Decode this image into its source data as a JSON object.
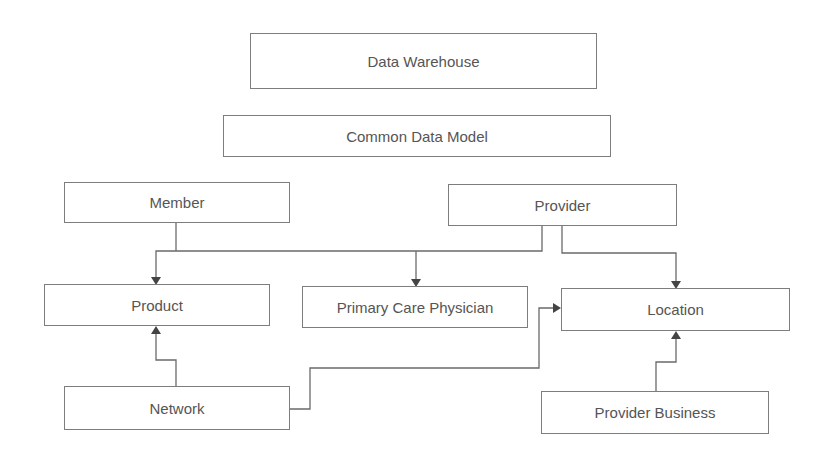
{
  "diagram": {
    "nodes": {
      "data_warehouse": "Data Warehouse",
      "common_data_model": "Common Data Model",
      "member": "Member",
      "provider": "Provider",
      "product": "Product",
      "primary_care_physician": "Primary Care Physician",
      "location": "Location",
      "network": "Network",
      "provider_business": "Provider Business"
    },
    "edges": [
      {
        "from": "Member",
        "to": "Product"
      },
      {
        "from": "Provider",
        "to": "Product"
      },
      {
        "from": "Provider",
        "to": "Primary Care Physician"
      },
      {
        "from": "Provider",
        "to": "Location"
      },
      {
        "from": "Network",
        "to": "Product"
      },
      {
        "from": "Network",
        "to": "Location"
      },
      {
        "from": "Provider Business",
        "to": "Location"
      }
    ],
    "colors": {
      "border": "#7d7d7d",
      "text": "#555555",
      "line": "#6a6a6a",
      "arrowhead": "#444444"
    }
  }
}
